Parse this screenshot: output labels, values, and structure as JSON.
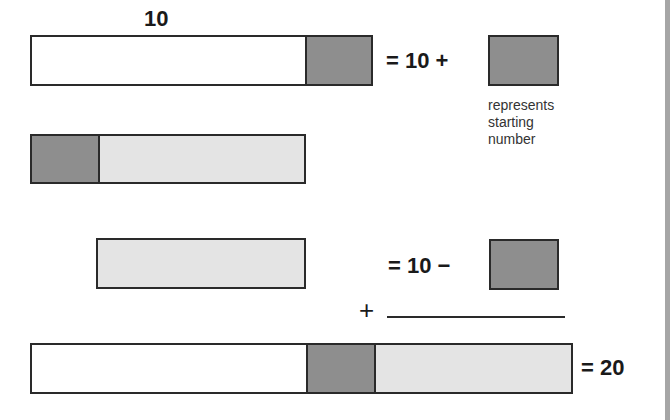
{
  "diagram": {
    "top_label": "10",
    "rows": [
      {
        "id": "row1",
        "segments": [
          {
            "kind": "white",
            "represents": "10"
          },
          {
            "kind": "dark",
            "represents": "starting number"
          }
        ],
        "equation": "= 10 +"
      },
      {
        "id": "row2",
        "segments": [
          {
            "kind": "dark",
            "represents": "starting number"
          },
          {
            "kind": "light",
            "represents": "remainder"
          }
        ]
      },
      {
        "id": "row3",
        "segments": [
          {
            "kind": "light",
            "represents": "remainder"
          }
        ],
        "equation": "= 10 −"
      },
      {
        "id": "row4",
        "segments": [
          {
            "kind": "white",
            "represents": "10"
          },
          {
            "kind": "dark",
            "represents": "starting number"
          },
          {
            "kind": "light",
            "represents": "remainder"
          }
        ],
        "equation": "= 20"
      }
    ],
    "legend": {
      "lines": [
        "represents",
        "starting",
        "number"
      ]
    },
    "plus_sign": "+",
    "colors": {
      "dark": "#8e8e8e",
      "light": "#e4e4e4",
      "white": "#ffffff",
      "outline": "#2a2a2a"
    }
  }
}
